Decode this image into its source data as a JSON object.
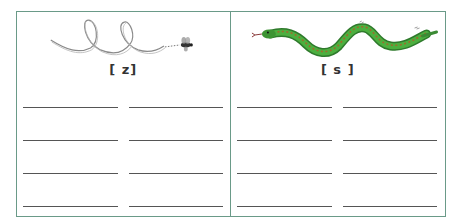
{
  "worksheet": {
    "border_color": "#6a9a88",
    "line_color": "#555555",
    "panels": [
      {
        "id": "z",
        "illustration": "buzzing-fly-looping-path",
        "label": "[ z]",
        "writing_lines": 8
      },
      {
        "id": "s",
        "illustration": "hissing-green-snake",
        "label": "[ s ]",
        "writing_lines": 8
      }
    ]
  }
}
